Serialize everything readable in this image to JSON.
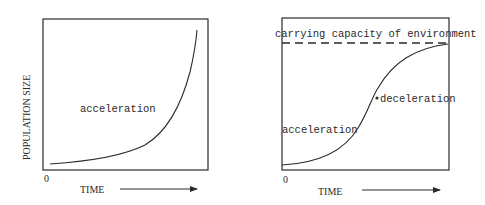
{
  "left_chart": {
    "y_axis_label": "POPULATION SIZE",
    "x_axis_label": "TIME",
    "origin_label": "0",
    "curve_label": "acceleration"
  },
  "right_chart": {
    "x_axis_label": "TIME",
    "origin_label": "0",
    "capacity_label": "carrying capacity of environment",
    "acceleration_label": "acceleration",
    "deceleration_label": "deceleration"
  },
  "colors": {
    "ink": "#2a2a2a",
    "background": "#ffffff"
  }
}
